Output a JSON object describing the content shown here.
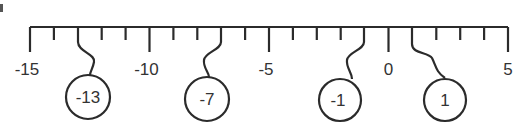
{
  "number_line": {
    "min": -15,
    "max": 5,
    "step": 1,
    "major_labels": [
      "-15",
      "-10",
      "-5",
      "0",
      "5"
    ],
    "major_values": [
      -15,
      -10,
      -5,
      0,
      5
    ]
  },
  "tags": [
    {
      "value": -13,
      "label": "-13"
    },
    {
      "value": -7,
      "label": "-7"
    },
    {
      "value": -1,
      "label": "-1"
    },
    {
      "value": 1,
      "label": "1"
    }
  ],
  "colors": {
    "line": "#2b2b2b",
    "text": "#333333",
    "background": "#ffffff"
  }
}
